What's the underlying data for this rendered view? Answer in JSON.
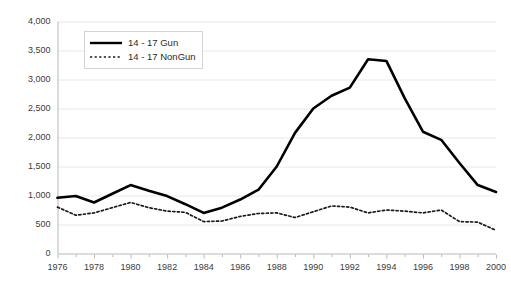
{
  "chart_data": {
    "type": "line",
    "title": "",
    "subtitle": "",
    "xlabel": "",
    "ylabel": "",
    "x": [
      1976,
      1977,
      1978,
      1979,
      1980,
      1981,
      1982,
      1983,
      1984,
      1985,
      1986,
      1987,
      1988,
      1989,
      1990,
      1991,
      1992,
      1993,
      1994,
      1995,
      1996,
      1997,
      1998,
      1999,
      2000
    ],
    "xlim": [
      1976,
      2000
    ],
    "ylim": [
      0,
      4000
    ],
    "ytick_values": [
      0,
      500,
      1000,
      1500,
      2000,
      2500,
      3000,
      3500,
      4000
    ],
    "ytick_labels": [
      "0",
      "500",
      "1,000",
      "1,500",
      "2,000",
      "2,500",
      "3,000",
      "3,500",
      "4,000"
    ],
    "xtick_values": [
      1976,
      1978,
      1980,
      1982,
      1984,
      1986,
      1988,
      1990,
      1992,
      1994,
      1996,
      1998,
      2000
    ],
    "xtick_labels": [
      "1976",
      "1978",
      "1980",
      "1982",
      "1984",
      "1986",
      "1988",
      "1990",
      "1992",
      "1994",
      "1996",
      "1998",
      "2000"
    ],
    "grid": true,
    "grid_axis": "y",
    "grid_color": "#e8e8e8",
    "axis_color": "#b8b8b8",
    "legend_position": "upper-left",
    "series": [
      {
        "name": "14 - 17 Gun",
        "style": "solid",
        "color": "#000000",
        "width": 2.6,
        "values": [
          960,
          990,
          880,
          1030,
          1180,
          1080,
          990,
          850,
          700,
          790,
          930,
          1100,
          1500,
          2080,
          2500,
          2720,
          2860,
          3350,
          3320,
          2680,
          2100,
          1960,
          1560,
          1180,
          1060
        ]
      },
      {
        "name": "14 - 17 NonGun",
        "style": "dotted",
        "color": "#1a1a1a",
        "width": 1.7,
        "values": [
          800,
          660,
          700,
          790,
          880,
          790,
          730,
          710,
          550,
          560,
          640,
          690,
          700,
          620,
          720,
          820,
          800,
          700,
          750,
          730,
          700,
          750,
          550,
          540,
          400
        ]
      }
    ]
  },
  "legend": {
    "items": [
      {
        "label": "14 - 17 Gun",
        "style": "solid"
      },
      {
        "label": "14 - 17 NonGun",
        "style": "dotted"
      }
    ]
  }
}
